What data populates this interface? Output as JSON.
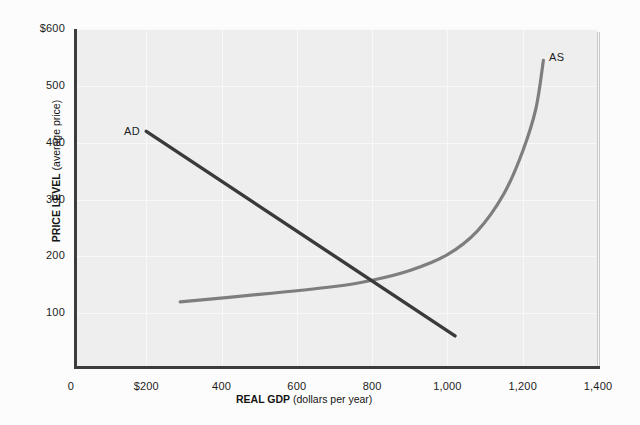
{
  "chart_data": {
    "type": "line",
    "title": "",
    "xlabel_strong": "REAL GDP",
    "xlabel_rest": " (dollars per year)",
    "ylabel_strong": "PRICE LEVEL",
    "ylabel_rest": " (average price)",
    "xlim": [
      0,
      1400
    ],
    "ylim": [
      0,
      600
    ],
    "grid": true,
    "legend_position": "inline-curve-labels",
    "xticks": [
      "0",
      "$200",
      "400",
      "600",
      "800",
      "1,000",
      "1,200",
      "1,400"
    ],
    "xtick_values": [
      0,
      200,
      400,
      600,
      800,
      1000,
      1200,
      1400
    ],
    "yticks": [
      "100",
      "200",
      "300",
      "400",
      "500",
      "$600"
    ],
    "ytick_values": [
      100,
      200,
      300,
      400,
      500,
      600
    ],
    "series": [
      {
        "name": "AD",
        "label": "AD",
        "color": "#3a3a3a",
        "kind": "straight-line",
        "description": "Aggregate demand, downward sloping straight line",
        "points": [
          {
            "x": 200,
            "y": 420
          },
          {
            "x": 1020,
            "y": 60
          }
        ]
      },
      {
        "name": "AS",
        "label": "AS",
        "color": "#7e7e7e",
        "kind": "curve",
        "description": "Aggregate supply, upward sloping curve steepening at high output",
        "points": [
          {
            "x": 290,
            "y": 120
          },
          {
            "x": 500,
            "y": 133
          },
          {
            "x": 700,
            "y": 147
          },
          {
            "x": 800,
            "y": 158
          },
          {
            "x": 900,
            "y": 175
          },
          {
            "x": 1000,
            "y": 203
          },
          {
            "x": 1080,
            "y": 245
          },
          {
            "x": 1150,
            "y": 310
          },
          {
            "x": 1200,
            "y": 385
          },
          {
            "x": 1235,
            "y": 460
          },
          {
            "x": 1255,
            "y": 545
          }
        ]
      }
    ],
    "equilibrium": {
      "x": 790,
      "y": 155
    }
  }
}
